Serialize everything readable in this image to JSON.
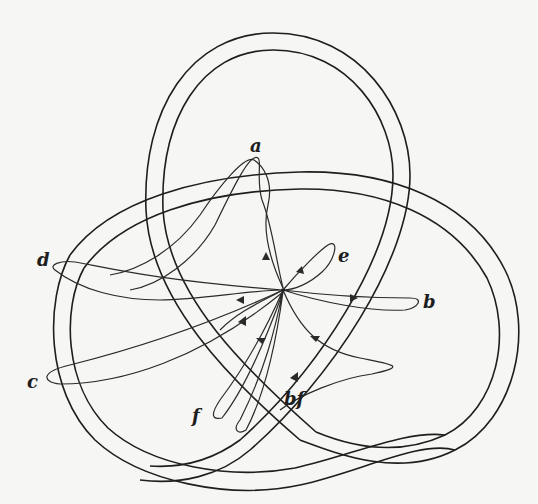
{
  "figure": {
    "labels": {
      "a": "a",
      "b": "b",
      "c": "c",
      "d": "d",
      "e": "e",
      "f": "f",
      "bf": "bf"
    },
    "colors": {
      "stroke": "#1e1e1e",
      "background": "#f6f6f4"
    }
  }
}
